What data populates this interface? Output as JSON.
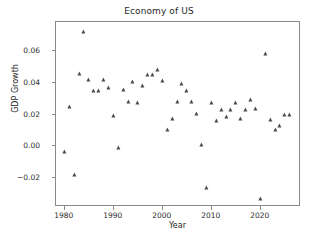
{
  "chart_data": {
    "type": "scatter",
    "title": "Economy of US",
    "xlabel": "Year",
    "ylabel": "GDP Growth",
    "grid": false,
    "legend": null,
    "marker": "triangle-up",
    "marker_color": "#4b4b4b",
    "xlim": [
      1978.2,
      1978.2
    ],
    "xlim_values": [
      1978.2,
      2028.2
    ],
    "ylim": [
      -0.038,
      0.078
    ],
    "xticks": [
      1980,
      1990,
      2000,
      2010,
      2020
    ],
    "xtick_labels": [
      "1980",
      "1990",
      "2000",
      "2010",
      "2020"
    ],
    "yticks": [
      -0.02,
      0.0,
      0.02,
      0.04,
      0.06
    ],
    "ytick_labels": [
      "−0.02",
      "0.00",
      "0.02",
      "0.04",
      "0.06"
    ],
    "x": [
      1980,
      1981,
      1982,
      1983,
      1984,
      1985,
      1986,
      1987,
      1988,
      1989,
      1990,
      1991,
      1992,
      1993,
      1994,
      1995,
      1996,
      1997,
      1998,
      1999,
      2000,
      2001,
      2002,
      2003,
      2004,
      2005,
      2006,
      2007,
      2008,
      2009,
      2010,
      2011,
      2012,
      2013,
      2014,
      2015,
      2016,
      2017,
      2018,
      2019,
      2020,
      2021,
      2022,
      2023,
      2024,
      2025,
      2026
    ],
    "y": [
      -0.0035,
      0.0248,
      -0.0179,
      0.0456,
      0.0718,
      0.0417,
      0.0347,
      0.0345,
      0.0418,
      0.0364,
      0.0192,
      -0.0011,
      0.0352,
      0.0279,
      0.0403,
      0.0271,
      0.0379,
      0.0445,
      0.0449,
      0.0479,
      0.041,
      0.0103,
      0.0174,
      0.0281,
      0.0392,
      0.0347,
      0.0279,
      0.0201,
      0.001,
      -0.0259,
      0.0271,
      0.016,
      0.0229,
      0.0184,
      0.0229,
      0.0271,
      0.0174,
      0.0229,
      0.029,
      0.0233,
      -0.0332,
      0.0578,
      0.0163,
      0.0105,
      0.0126,
      0.0195,
      0.0199
    ],
    "series_name": "GDP Growth",
    "n_points": 47
  },
  "figure": {
    "background": "#ffffff",
    "axes_edge_color": "#8a8a8a",
    "text_color": "#262626"
  }
}
